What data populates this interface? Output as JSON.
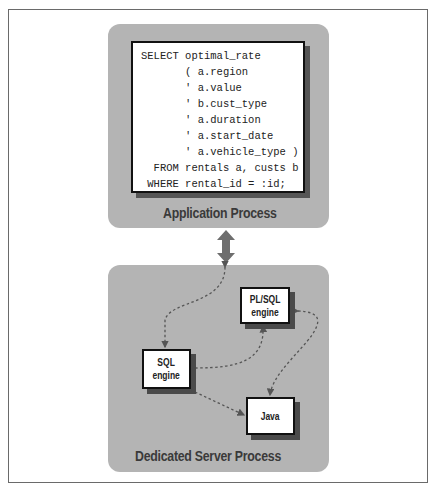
{
  "application_process": {
    "title": "Application Process",
    "code_lines": [
      "SELECT optimal_rate",
      "       ( a.region",
      "       ' a.value",
      "       ' b.cust_type",
      "       ' a.duration",
      "       ' a.start_date",
      "       ' a.vehicle_type )",
      "  FROM rentals a, custs b",
      " WHERE rental_id = :id;"
    ]
  },
  "server_process": {
    "title": "Dedicated Server Process",
    "engines": {
      "plsql": {
        "line1": "PL/SQL",
        "line2": "engine"
      },
      "sql": {
        "line1": "SQL",
        "line2": "engine"
      },
      "java": {
        "line1": "Java"
      }
    }
  },
  "colors": {
    "panel": "#b4b4b4",
    "arrow": "#6e6e6e",
    "border": "#111111"
  }
}
